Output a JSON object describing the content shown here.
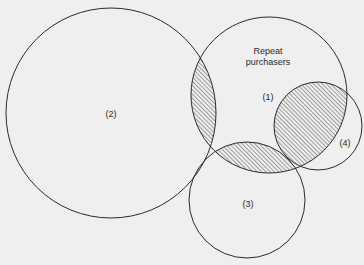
{
  "diagram": {
    "type": "venn",
    "colors": {
      "background": "#efefef",
      "stroke": "#2a2a2a",
      "hatch": "#555555"
    },
    "circles": [
      {
        "id": "1",
        "label": "(1)",
        "caption_line1": "Repeat",
        "caption_line2": "purchasers"
      },
      {
        "id": "2",
        "label": "(2)"
      },
      {
        "id": "3",
        "label": "(3)"
      },
      {
        "id": "4",
        "label": "(4)"
      }
    ],
    "hatched_intersections": [
      "1∩2",
      "1∩3",
      "1∩4"
    ]
  }
}
